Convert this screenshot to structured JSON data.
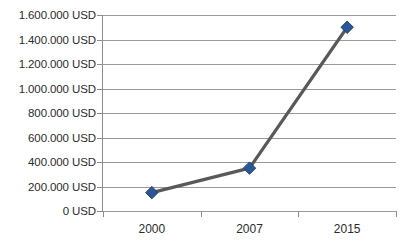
{
  "chart_data": {
    "type": "line",
    "title": "",
    "subtitle": "",
    "xlabel": "",
    "ylabel": "",
    "categories": [
      "2000",
      "2007",
      "2015"
    ],
    "values": [
      150000,
      350000,
      1500000
    ],
    "series": [
      {
        "name": "",
        "values": [
          150000,
          350000,
          1500000
        ],
        "line_color": "#595959",
        "marker_color": "#2b5797",
        "marker_shape": "diamond"
      }
    ],
    "ylim": [
      0,
      1600000
    ],
    "y_ticks": [
      0,
      200000,
      400000,
      600000,
      800000,
      1000000,
      1200000,
      1400000,
      1600000
    ],
    "y_tick_labels": [
      "0 USD",
      "200.000 USD",
      "400.000 USD",
      "600.000 USD",
      "800.000 USD",
      "1.000.000 USD",
      "1.200.000 USD",
      "1.400.000 USD",
      "1.600.000 USD"
    ],
    "x_tick_labels": [
      "2000",
      "2007",
      "2015"
    ],
    "grid": {
      "horizontal": true,
      "vertical": false,
      "color": "#9a9a9a"
    },
    "legend": {
      "visible": false,
      "position": "none",
      "entries": []
    },
    "annotations": [],
    "currency": "USD",
    "thousands_separator": ".",
    "axis_color": "#8d8d8d",
    "background_color": "#ffffff",
    "text_color": "#2b2b2b"
  }
}
